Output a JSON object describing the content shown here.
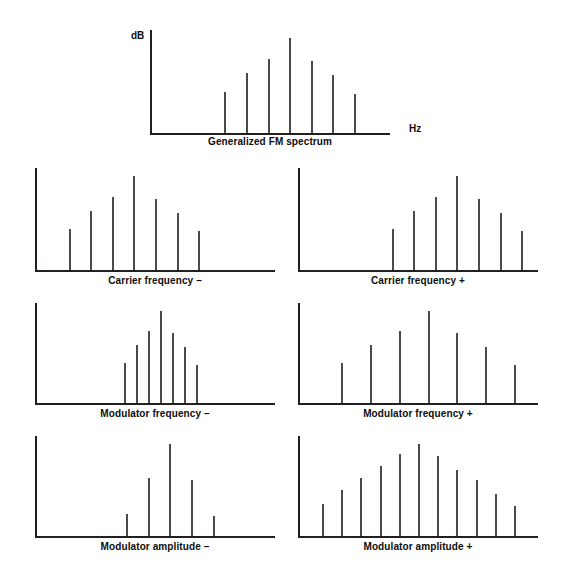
{
  "figure": {
    "axis_labels": {
      "y": "dB",
      "x": "Hz"
    },
    "colors": {
      "axis": "#231f20",
      "line": "#4a4a4a",
      "text": "#0d0d0d",
      "background": "#ffffff"
    }
  },
  "panels": [
    {
      "id": "top",
      "caption": "Generalized FM spectrum"
    },
    {
      "id": "cf-minus",
      "caption": "Carrier frequency –"
    },
    {
      "id": "cf-plus",
      "caption": "Carrier frequency +"
    },
    {
      "id": "mf-minus",
      "caption": "Modulator frequency –"
    },
    {
      "id": "mf-plus",
      "caption": "Modulator frequency +"
    },
    {
      "id": "ma-minus",
      "caption": "Modulator amplitude –"
    },
    {
      "id": "ma-plus",
      "caption": "Modulator amplitude +"
    }
  ],
  "chart_data": [
    {
      "type": "bar",
      "id": "top",
      "title": "Generalized FM spectrum",
      "xlabel": "Hz",
      "ylabel": "dB",
      "grid": false,
      "legend": false,
      "xlim": [
        0,
        100
      ],
      "ylim": [
        0,
        100
      ],
      "x": [
        31,
        40,
        49,
        58,
        67,
        76,
        85
      ],
      "values": [
        40,
        58,
        72,
        92,
        70,
        56,
        38
      ]
    },
    {
      "type": "bar",
      "id": "cf-minus",
      "title": "Carrier frequency –",
      "xlabel": "",
      "ylabel": "",
      "grid": false,
      "legend": false,
      "xlim": [
        0,
        100
      ],
      "ylim": [
        0,
        100
      ],
      "x": [
        14,
        23,
        32,
        41,
        50,
        59,
        68
      ],
      "values": [
        40,
        58,
        72,
        92,
        70,
        56,
        38
      ]
    },
    {
      "type": "bar",
      "id": "cf-plus",
      "title": "Carrier frequency +",
      "xlabel": "",
      "ylabel": "",
      "grid": false,
      "legend": false,
      "xlim": [
        0,
        100
      ],
      "ylim": [
        0,
        100
      ],
      "x": [
        39,
        48,
        57,
        66,
        75,
        84,
        93
      ],
      "values": [
        40,
        58,
        72,
        92,
        70,
        56,
        38
      ]
    },
    {
      "type": "bar",
      "id": "mf-minus",
      "title": "Modulator frequency –",
      "xlabel": "",
      "ylabel": "",
      "grid": false,
      "legend": false,
      "xlim": [
        0,
        100
      ],
      "ylim": [
        0,
        100
      ],
      "x": [
        37,
        42,
        47,
        52,
        57,
        62,
        67
      ],
      "values": [
        40,
        58,
        72,
        92,
        70,
        56,
        38
      ]
    },
    {
      "type": "bar",
      "id": "mf-plus",
      "title": "Modulator frequency +",
      "xlabel": "",
      "ylabel": "",
      "grid": false,
      "legend": false,
      "xlim": [
        0,
        100
      ],
      "ylim": [
        0,
        100
      ],
      "x": [
        18,
        30,
        42,
        54,
        66,
        78,
        90
      ],
      "values": [
        40,
        58,
        72,
        92,
        70,
        56,
        38
      ]
    },
    {
      "type": "bar",
      "id": "ma-minus",
      "title": "Modulator amplitude –",
      "xlabel": "",
      "ylabel": "",
      "grid": false,
      "legend": false,
      "xlim": [
        0,
        100
      ],
      "ylim": [
        0,
        100
      ],
      "x": [
        38,
        47,
        56,
        65,
        74
      ],
      "values": [
        22,
        58,
        92,
        56,
        20
      ]
    },
    {
      "type": "bar",
      "id": "ma-plus",
      "title": "Modulator amplitude +",
      "xlabel": "",
      "ylabel": "",
      "grid": false,
      "legend": false,
      "xlim": [
        0,
        100
      ],
      "ylim": [
        0,
        100
      ],
      "x": [
        10,
        18,
        26,
        34,
        42,
        50,
        58,
        66,
        74,
        82,
        90
      ],
      "values": [
        32,
        46,
        58,
        70,
        82,
        92,
        80,
        66,
        56,
        42,
        30
      ]
    }
  ]
}
